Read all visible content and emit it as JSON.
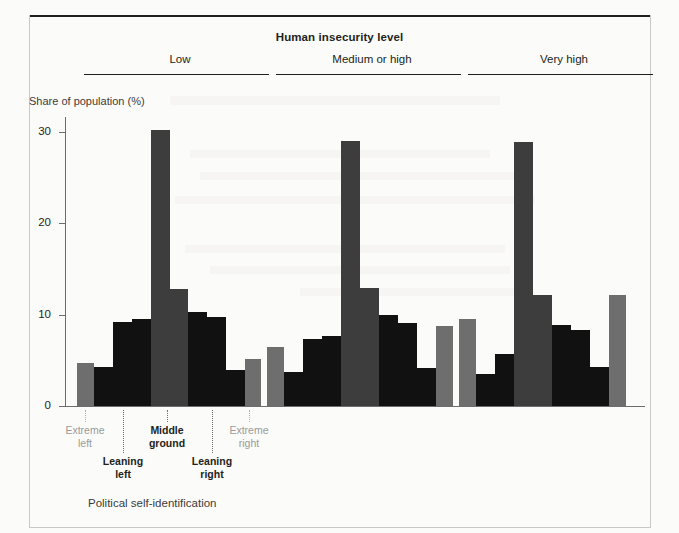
{
  "title": "Human insecurity level",
  "axes": {
    "y_title": "Share of population (%)",
    "x_title": "Political self-identification",
    "y_ticks": [
      "0",
      "10",
      "20",
      "30"
    ]
  },
  "groups": [
    {
      "label": "Low"
    },
    {
      "label": "Medium or high"
    },
    {
      "label": "Very high"
    }
  ],
  "category_labels": [
    {
      "line1": "Extreme",
      "line2": "left",
      "style": "muted"
    },
    {
      "line1": "Leaning",
      "line2": "left",
      "style": "strong"
    },
    {
      "line1": "Middle",
      "line2": "ground",
      "style": "strong"
    },
    {
      "line1": "Leaning",
      "line2": "right",
      "style": "strong"
    },
    {
      "line1": "Extreme",
      "line2": "right",
      "style": "muted"
    }
  ],
  "colors": {
    "bar_light_gray": "#6e6e6e",
    "bar_mid_gray": "#3d3d3d",
    "bar_black": "#111111",
    "axis": "#6d6d6d",
    "text": "#231f20",
    "muted_text": "#9a9a9a",
    "background": "#fbfbf9"
  },
  "chart_data": {
    "type": "bar",
    "title": "Human insecurity level",
    "xlabel": "Political self-identification",
    "ylabel": "Share of population (%)",
    "ylim": [
      0,
      31
    ],
    "yticks": [
      0,
      10,
      20,
      30
    ],
    "grid": false,
    "legend": "none",
    "note": "Each of the three panels (Low / Medium or high / Very high human insecurity) shows an 11-step political self-identification scale from extreme left to extreme right. The first, middle and last bars of each panel are drawn in grey, the intermediate bars in black.",
    "groups": [
      {
        "name": "Low",
        "categories": [
          "Extreme left",
          "2",
          "3",
          "4",
          "5",
          "Middle ground",
          "7",
          "8",
          "9",
          "10",
          "Extreme right"
        ],
        "values": [
          4.7,
          4.3,
          9.2,
          9.5,
          30.2,
          12.8,
          10.3,
          9.7,
          3.9,
          5.1
        ],
        "bar_colors": [
          "light",
          "black",
          "black",
          "black",
          "mid",
          "mid",
          "black",
          "black",
          "black",
          "light"
        ]
      },
      {
        "name": "Medium or high",
        "categories": [
          "Extreme left",
          "2",
          "3",
          "4",
          "5",
          "Middle ground",
          "7",
          "8",
          "9",
          "10",
          "Extreme right"
        ],
        "values": [
          6.4,
          3.7,
          7.3,
          7.6,
          29.0,
          12.9,
          10.0,
          9.1,
          4.2,
          8.7
        ],
        "bar_colors": [
          "light",
          "black",
          "black",
          "black",
          "mid",
          "mid",
          "black",
          "black",
          "black",
          "light"
        ]
      },
      {
        "name": "Very high",
        "categories": [
          "Extreme left",
          "2",
          "3",
          "4",
          "5",
          "Middle ground",
          "7",
          "8",
          "9",
          "10",
          "Extreme right"
        ],
        "values": [
          9.5,
          3.5,
          5.7,
          28.9,
          12.1,
          8.9,
          8.3,
          4.3,
          12.1
        ],
        "bar_colors": [
          "light",
          "black",
          "black",
          "mid",
          "mid",
          "black",
          "black",
          "black",
          "light"
        ]
      }
    ]
  },
  "layout": {
    "plot_left": 65,
    "plot_right": 645,
    "baseline_y": 406,
    "y_top_value": 31.6,
    "y_top_px": 117,
    "bars": [
      {
        "x": 77,
        "w": 17,
        "v": 4.7,
        "c": "light"
      },
      {
        "x": 94,
        "w": 19,
        "v": 4.3,
        "c": "black"
      },
      {
        "x": 113,
        "w": 19,
        "v": 9.2,
        "c": "black"
      },
      {
        "x": 132,
        "w": 19,
        "v": 9.5,
        "c": "black"
      },
      {
        "x": 151,
        "w": 19,
        "v": 30.2,
        "c": "mid"
      },
      {
        "x": 170,
        "w": 18,
        "v": 12.8,
        "c": "mid"
      },
      {
        "x": 188,
        "w": 19,
        "v": 10.3,
        "c": "black"
      },
      {
        "x": 207,
        "w": 19,
        "v": 9.7,
        "c": "black"
      },
      {
        "x": 226,
        "w": 19,
        "v": 3.9,
        "c": "black"
      },
      {
        "x": 245,
        "w": 16,
        "v": 5.1,
        "c": "light"
      },
      {
        "x": 267,
        "w": 17,
        "v": 6.4,
        "c": "light"
      },
      {
        "x": 284,
        "w": 19,
        "v": 3.7,
        "c": "black"
      },
      {
        "x": 303,
        "w": 19,
        "v": 7.3,
        "c": "black"
      },
      {
        "x": 322,
        "w": 19,
        "v": 7.6,
        "c": "black"
      },
      {
        "x": 341,
        "w": 19,
        "v": 29.0,
        "c": "mid"
      },
      {
        "x": 360,
        "w": 19,
        "v": 12.9,
        "c": "mid"
      },
      {
        "x": 379,
        "w": 19,
        "v": 10.0,
        "c": "black"
      },
      {
        "x": 398,
        "w": 19,
        "v": 9.1,
        "c": "black"
      },
      {
        "x": 417,
        "w": 19,
        "v": 4.2,
        "c": "black"
      },
      {
        "x": 436,
        "w": 17,
        "v": 8.7,
        "c": "light"
      },
      {
        "x": 459,
        "w": 17,
        "v": 9.5,
        "c": "light"
      },
      {
        "x": 476,
        "w": 19,
        "v": 3.5,
        "c": "black"
      },
      {
        "x": 495,
        "w": 19,
        "v": 5.7,
        "c": "black"
      },
      {
        "x": 514,
        "w": 19,
        "v": 28.9,
        "c": "mid"
      },
      {
        "x": 533,
        "w": 19,
        "v": 12.1,
        "c": "mid"
      },
      {
        "x": 552,
        "w": 19,
        "v": 8.9,
        "c": "black"
      },
      {
        "x": 571,
        "w": 19,
        "v": 8.3,
        "c": "black"
      },
      {
        "x": 590,
        "w": 19,
        "v": 4.3,
        "c": "black"
      },
      {
        "x": 609,
        "w": 17,
        "v": 12.1,
        "c": "light"
      }
    ],
    "group_heads": [
      {
        "label_left": 80,
        "label_width": 200,
        "rule_left": 84,
        "rule_width": 185
      },
      {
        "label_left": 272,
        "label_width": 200,
        "rule_left": 276,
        "rule_width": 185
      },
      {
        "label_left": 464,
        "label_width": 200,
        "rule_left": 468,
        "rule_width": 185
      }
    ],
    "x_labels": [
      {
        "cx": 85,
        "top": 424,
        "leader_top": 410,
        "leader_h": 12,
        "style": "muted"
      },
      {
        "cx": 123,
        "top": 455,
        "leader_top": 410,
        "leader_h": 43,
        "style": "strong"
      },
      {
        "cx": 167,
        "top": 424,
        "leader_top": 410,
        "leader_h": 12,
        "style": "strong"
      },
      {
        "cx": 212,
        "top": 455,
        "leader_top": 410,
        "leader_h": 43,
        "style": "strong"
      },
      {
        "cx": 249,
        "top": 424,
        "leader_top": 410,
        "leader_h": 12,
        "style": "muted"
      }
    ]
  }
}
